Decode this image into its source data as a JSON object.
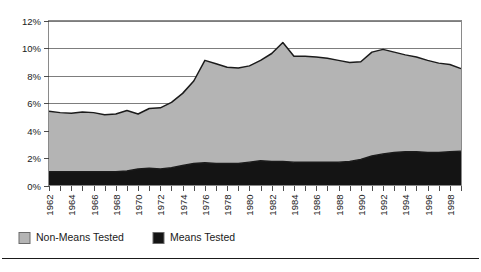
{
  "chart_data": {
    "type": "area",
    "stacked": true,
    "title": "",
    "subtitle": "",
    "xlabel": "",
    "ylabel": "",
    "grid": true,
    "legend_position": "bottom-left",
    "ylim": [
      0,
      12
    ],
    "yticks": [
      0,
      2,
      4,
      6,
      8,
      10,
      12
    ],
    "ytick_labels": [
      "0%",
      "2%",
      "4%",
      "6%",
      "8%",
      "10%",
      "12%"
    ],
    "xlim": [
      1962,
      1999
    ],
    "x": [
      1962,
      1963,
      1964,
      1965,
      1966,
      1967,
      1968,
      1969,
      1970,
      1971,
      1972,
      1973,
      1974,
      1975,
      1976,
      1977,
      1978,
      1979,
      1980,
      1981,
      1982,
      1983,
      1984,
      1985,
      1986,
      1987,
      1988,
      1989,
      1990,
      1991,
      1992,
      1993,
      1994,
      1995,
      1996,
      1997,
      1998,
      1999
    ],
    "xticks": [
      1962,
      1963,
      1964,
      1965,
      1966,
      1967,
      1968,
      1969,
      1970,
      1971,
      1972,
      1973,
      1974,
      1975,
      1976,
      1977,
      1978,
      1979,
      1980,
      1981,
      1982,
      1983,
      1984,
      1985,
      1986,
      1987,
      1988,
      1989,
      1990,
      1991,
      1992,
      1993,
      1994,
      1995,
      1996,
      1997,
      1998,
      1999
    ],
    "xtick_labels": [
      "1962",
      "",
      "1964",
      "",
      "1966",
      "",
      "1968",
      "",
      "1970",
      "",
      "1972",
      "",
      "1974",
      "",
      "1976",
      "",
      "1978",
      "",
      "1980",
      "",
      "1982",
      "",
      "1984",
      "",
      "1986",
      "",
      "1988",
      "",
      "1990",
      "",
      "1992",
      "",
      "1994",
      "",
      "1996",
      "",
      "1998",
      ""
    ],
    "series": [
      {
        "name": "Means Tested",
        "color": "#141414",
        "values": [
          1.0,
          1.0,
          1.0,
          1.0,
          1.0,
          1.0,
          1.0,
          1.05,
          1.2,
          1.25,
          1.2,
          1.3,
          1.45,
          1.6,
          1.65,
          1.6,
          1.6,
          1.6,
          1.7,
          1.8,
          1.75,
          1.75,
          1.7,
          1.7,
          1.7,
          1.7,
          1.7,
          1.75,
          1.9,
          2.15,
          2.3,
          2.4,
          2.45,
          2.45,
          2.4,
          2.4,
          2.45,
          2.5
        ]
      },
      {
        "name": "Non-Means Tested",
        "color": "#b4b4b4",
        "values": [
          4.4,
          4.3,
          4.25,
          4.35,
          4.3,
          4.15,
          4.2,
          4.4,
          4.0,
          4.35,
          4.45,
          4.75,
          5.25,
          6.0,
          7.45,
          7.25,
          7.0,
          6.95,
          7.0,
          7.3,
          7.85,
          8.65,
          7.7,
          7.7,
          7.65,
          7.55,
          7.4,
          7.2,
          7.1,
          7.55,
          7.6,
          7.3,
          7.05,
          6.9,
          6.7,
          6.5,
          6.35,
          6.0
        ]
      }
    ],
    "totals": [
      5.4,
      5.3,
      5.25,
      5.35,
      5.3,
      5.15,
      5.2,
      5.45,
      5.2,
      5.6,
      5.65,
      6.05,
      6.7,
      7.6,
      9.1,
      8.85,
      8.6,
      8.55,
      8.7,
      9.1,
      9.6,
      10.4,
      9.4,
      9.4,
      9.35,
      9.25,
      9.1,
      8.95,
      9.0,
      9.7,
      9.9,
      9.7,
      9.5,
      9.35,
      9.1,
      8.9,
      8.8,
      8.5
    ]
  },
  "legend": {
    "items": [
      {
        "label": "Non-Means Tested",
        "color": "#b4b4b4"
      },
      {
        "label": "Means Tested",
        "color": "#141414"
      }
    ]
  }
}
